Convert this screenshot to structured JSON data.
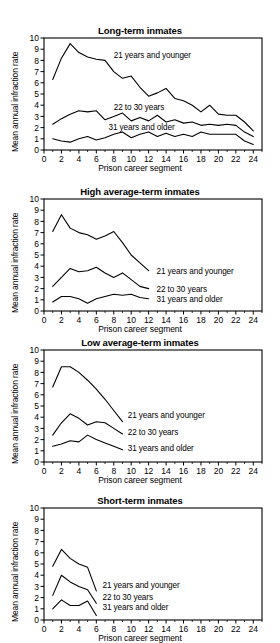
{
  "figure": {
    "width": 280,
    "height": 642,
    "background": "#ffffff",
    "line_color": "#000000",
    "axis_color": "#000000"
  },
  "axis_common": {
    "xlabel": "Prison career segment",
    "ylabel": "Mean annual infraction rate",
    "xlim": [
      0,
      25
    ],
    "ylim": [
      0,
      10
    ],
    "xticks": [
      0,
      2,
      4,
      6,
      8,
      10,
      12,
      14,
      16,
      18,
      20,
      22,
      24
    ],
    "xticklabels": [
      "0",
      "2",
      "4",
      "6",
      "8",
      "10",
      "12",
      "14",
      "16",
      "18",
      "20",
      "22",
      "24"
    ],
    "yticks": [
      0,
      1,
      2,
      3,
      4,
      5,
      6,
      7,
      8,
      9,
      10
    ],
    "yticklabels": [
      "0",
      "1",
      "2",
      "3",
      "4",
      "5",
      "6",
      "7",
      "8",
      "9",
      "10"
    ],
    "grid": false,
    "legend_position": "inline-annotations"
  },
  "chart_data": [
    {
      "type": "line",
      "panel_index": 0,
      "title": "Long-term inmates",
      "xlabel": "Prison career segment",
      "ylabel": "Mean annual infraction rate",
      "xlim": [
        0,
        25
      ],
      "ylim": [
        0,
        10
      ],
      "grid": false,
      "series": [
        {
          "name": "21 years and younger",
          "label_x": 8.0,
          "label_y": 8.5,
          "x": [
            1,
            2,
            3,
            4,
            5,
            6,
            7,
            8,
            9,
            10,
            11,
            12,
            13,
            14,
            15,
            16,
            17,
            18,
            19,
            20,
            21,
            22,
            23,
            24
          ],
          "values": [
            6.3,
            8.2,
            9.5,
            8.7,
            8.3,
            8.1,
            8.0,
            7.0,
            6.4,
            6.6,
            5.6,
            4.8,
            5.1,
            5.5,
            4.6,
            4.4,
            4.0,
            3.4,
            4.0,
            3.2,
            3.1,
            3.1,
            2.5,
            1.7
          ]
        },
        {
          "name": "22 to 30 years",
          "label_x": 8.0,
          "label_y": 3.9,
          "x": [
            1,
            2,
            3,
            4,
            5,
            6,
            7,
            8,
            9,
            10,
            11,
            12,
            13,
            14,
            15,
            16,
            17,
            18,
            19,
            20,
            21,
            22,
            23,
            24
          ],
          "values": [
            2.3,
            2.8,
            3.2,
            3.5,
            3.4,
            3.5,
            2.7,
            3.0,
            3.3,
            2.6,
            2.9,
            2.6,
            3.1,
            2.5,
            2.7,
            2.4,
            2.5,
            2.2,
            2.3,
            2.2,
            2.3,
            2.2,
            1.6,
            1.2
          ]
        },
        {
          "name": "31 years and older",
          "label_x": 7.4,
          "label_y": 2.1,
          "x": [
            1,
            2,
            3,
            4,
            5,
            6,
            7,
            8,
            9,
            10,
            11,
            12,
            13,
            14,
            15,
            16,
            17,
            18,
            19,
            20,
            21,
            22,
            23,
            24
          ],
          "values": [
            1.0,
            0.8,
            0.7,
            1.0,
            1.2,
            0.9,
            1.1,
            1.4,
            1.6,
            1.1,
            1.4,
            1.6,
            1.2,
            1.5,
            1.2,
            1.4,
            1.2,
            1.6,
            1.4,
            1.4,
            1.4,
            1.4,
            0.8,
            0.5
          ]
        }
      ]
    },
    {
      "type": "line",
      "panel_index": 1,
      "title": "High average-term inmates",
      "xlabel": "Prison career segment",
      "ylabel": "Mean annual infraction rate",
      "xlim": [
        0,
        25
      ],
      "ylim": [
        0,
        10
      ],
      "grid": false,
      "series": [
        {
          "name": "21 years and younger",
          "label_x": 12.9,
          "label_y": 3.6,
          "x": [
            1,
            2,
            3,
            4,
            5,
            6,
            7,
            8,
            9,
            10,
            11,
            12
          ],
          "values": [
            7.1,
            8.6,
            7.4,
            7.0,
            6.8,
            6.4,
            6.7,
            7.1,
            6.1,
            5.0,
            4.3,
            3.6
          ]
        },
        {
          "name": "22 to 30 years",
          "label_x": 12.9,
          "label_y": 2.0,
          "x": [
            1,
            2,
            3,
            4,
            5,
            6,
            7,
            8,
            9,
            10,
            11,
            12
          ],
          "values": [
            2.2,
            3.0,
            3.8,
            3.5,
            3.6,
            3.9,
            3.4,
            3.0,
            3.4,
            2.8,
            2.2,
            2.0
          ]
        },
        {
          "name": "31 years and older",
          "label_x": 12.9,
          "label_y": 1.1,
          "x": [
            1,
            2,
            3,
            4,
            5,
            6,
            7,
            8,
            9,
            10,
            11,
            12
          ],
          "values": [
            0.8,
            1.3,
            1.3,
            1.1,
            0.7,
            1.1,
            1.3,
            1.5,
            1.4,
            1.5,
            1.2,
            1.1
          ]
        }
      ]
    },
    {
      "type": "line",
      "panel_index": 2,
      "title": "Low average-term inmates",
      "xlabel": "Prison career segment",
      "ylabel": "Mean annual infraction rate",
      "xlim": [
        0,
        25
      ],
      "ylim": [
        0,
        10
      ],
      "grid": false,
      "series": [
        {
          "name": "21 years and younger",
          "label_x": 9.6,
          "label_y": 4.2,
          "x": [
            1,
            2,
            3,
            4,
            5,
            6,
            7,
            8,
            9
          ],
          "values": [
            6.7,
            8.5,
            8.5,
            8.0,
            7.3,
            6.5,
            5.6,
            4.6,
            3.6
          ]
        },
        {
          "name": "22 to 30 years",
          "label_x": 9.6,
          "label_y": 2.7,
          "x": [
            1,
            2,
            3,
            4,
            5,
            6,
            7,
            8,
            9
          ],
          "values": [
            2.4,
            3.5,
            4.3,
            3.9,
            3.3,
            3.6,
            3.5,
            3.0,
            2.5
          ]
        },
        {
          "name": "31 years and older",
          "label_x": 9.6,
          "label_y": 1.3,
          "x": [
            1,
            2,
            3,
            4,
            5,
            6,
            7,
            8,
            9
          ],
          "values": [
            1.4,
            1.6,
            1.9,
            1.8,
            2.4,
            2.0,
            1.7,
            1.4,
            1.1
          ]
        }
      ]
    },
    {
      "type": "line",
      "panel_index": 3,
      "title": "Short-term inmates",
      "xlabel": "Prison career segment",
      "ylabel": "Mean annual infraction rate",
      "xlim": [
        0,
        25
      ],
      "ylim": [
        0,
        10
      ],
      "grid": false,
      "series": [
        {
          "name": "21 years and younger",
          "label_x": 6.7,
          "label_y": 3.1,
          "x": [
            1,
            2,
            3,
            4,
            5,
            6
          ],
          "values": [
            4.8,
            6.3,
            5.5,
            5.0,
            4.7,
            2.6
          ]
        },
        {
          "name": "22 to 30 years",
          "label_x": 6.7,
          "label_y": 2.1,
          "x": [
            1,
            2,
            3,
            4,
            5,
            6
          ],
          "values": [
            2.2,
            4.0,
            3.4,
            3.0,
            2.7,
            1.5
          ]
        },
        {
          "name": "31 years and older",
          "label_x": 6.7,
          "label_y": 1.2,
          "x": [
            1,
            2,
            3,
            4,
            5,
            6
          ],
          "values": [
            1.0,
            1.8,
            1.3,
            1.3,
            1.7,
            0.4
          ]
        }
      ]
    }
  ]
}
